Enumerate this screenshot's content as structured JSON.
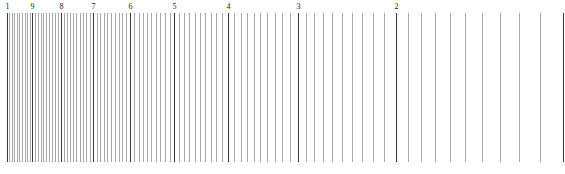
{
  "diagram": {
    "type": "logarithmic-scale",
    "orientation": "reversed (decreasing left to right)",
    "range": [
      1,
      10
    ],
    "minor_step": 0.1,
    "major_labels": [
      {
        "value": 10,
        "text": "1"
      },
      {
        "value": 9,
        "text": "9"
      },
      {
        "value": 8,
        "text": "8"
      },
      {
        "value": 7,
        "text": "7"
      },
      {
        "value": 6,
        "text": "6"
      },
      {
        "value": 5,
        "text": "5"
      },
      {
        "value": 4,
        "text": "4"
      },
      {
        "value": 3,
        "text": "3"
      },
      {
        "value": 2,
        "text": "2"
      },
      {
        "value": 1,
        "text": ""
      }
    ],
    "colors": {
      "major_line": "#3a3a3a",
      "minor_line": "#a8a8a8",
      "label": "#222222",
      "background": "#ffffff"
    }
  }
}
